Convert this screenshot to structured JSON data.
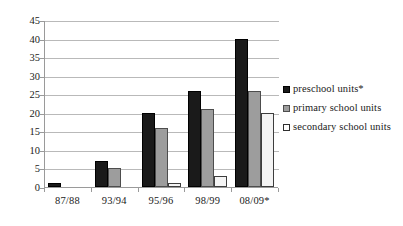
{
  "chart_data": {
    "type": "bar",
    "title": "",
    "subtitle": "",
    "xlabel": "",
    "ylabel": "",
    "categories": [
      "87/88",
      "93/94",
      "95/96",
      "98/99",
      "08/09*"
    ],
    "series": [
      {
        "name": "preschool units*",
        "values": [
          1,
          7,
          20,
          26,
          40
        ]
      },
      {
        "name": "primary school units",
        "values": [
          0,
          5,
          16,
          21,
          26
        ]
      },
      {
        "name": "secondary school units",
        "values": [
          0,
          0,
          1,
          3,
          20
        ]
      }
    ],
    "ylim": [
      0,
      45
    ],
    "ytick_values": [
      0,
      5,
      10,
      15,
      20,
      25,
      30,
      35,
      40,
      45
    ],
    "ytick_labels": [
      "0",
      "5",
      "10",
      "15",
      "20",
      "25",
      "30",
      "35",
      "40",
      "45"
    ],
    "grid": {
      "horizontal": true,
      "vertical": false
    },
    "legend": {
      "position": "right",
      "entries": [
        {
          "label": "preschool units*",
          "color": "#1a1a1a",
          "swatch": "filled-black"
        },
        {
          "label": "primary school units",
          "color": "#9d9d9d",
          "swatch": "filled-gray"
        },
        {
          "label": "secondary school units",
          "color": "#ffffff",
          "swatch": "outlined-white"
        }
      ]
    },
    "colors": {
      "series_black": "#1a1a1a",
      "series_gray": "#9d9d9d",
      "series_white": "#f4f4f4",
      "gridline": "#b9b9b9",
      "axis": "#9a9a9a",
      "text": "#1a1a1a",
      "background": "#ffffff"
    }
  }
}
